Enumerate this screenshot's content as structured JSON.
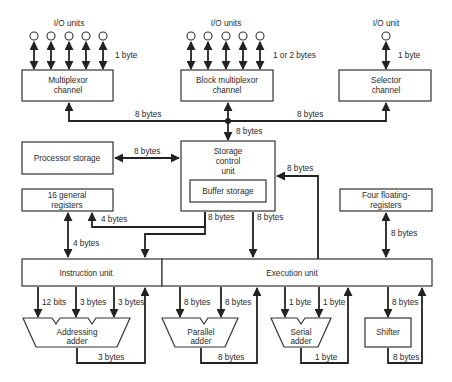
{
  "io_groups": {
    "multiplexor_io_label": "I/O units",
    "block_io_label": "I/O units",
    "selector_io_label": "I/O unit"
  },
  "widths": {
    "multiplexor_io": "1 byte",
    "block_io": "1 or 2 bytes",
    "selector_io": "1 byte",
    "mux_bus": "8 bytes",
    "selector_bus": "8 bytes",
    "bus_to_scu": "8 bytes",
    "proc_storage": "8 bytes",
    "exec_to_scu": "8 bytes",
    "scu_to_iu": "8 bytes",
    "scu_to_eu": "8 bytes",
    "regs_feedback": "4 bytes",
    "regs_iu": "4 bytes",
    "float_regs": "8 bytes",
    "addr_in1": "12 bits",
    "addr_in2": "3 bytes",
    "addr_in3": "3 bytes",
    "addr_out": "3 bytes",
    "par_in1": "8 bytes",
    "par_in2": "8 bytes",
    "par_out": "8 bytes",
    "ser_in1": "1 byte",
    "ser_in2": "1 byte",
    "ser_out": "1 byte",
    "shift_in": "8 bytes",
    "shift_out": "8 bytes"
  },
  "blocks": {
    "multiplexor": [
      "Multiplexor",
      "channel"
    ],
    "block_multiplexor": [
      "Block multiplexor",
      "channel"
    ],
    "selector": [
      "Selector",
      "channel"
    ],
    "processor_storage": "Processor storage",
    "storage_control": [
      "Storage",
      "control",
      "unit"
    ],
    "buffer_storage": "Buffer storage",
    "general_registers": [
      "16 general",
      "registers"
    ],
    "floating_registers": [
      "Four floating-",
      "registers"
    ],
    "instruction_unit": "Instruction unit",
    "execution_unit": "Execution unit",
    "addressing_adder": [
      "Addressing",
      "adder"
    ],
    "parallel_adder": [
      "Parallel",
      "adder"
    ],
    "serial_adder": [
      "Serial",
      "adder"
    ],
    "shifter": "Shifter"
  }
}
